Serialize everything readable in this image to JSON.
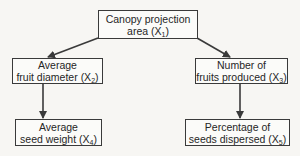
{
  "diagram": {
    "type": "flowchart",
    "nodes": [
      {
        "id": "X1",
        "line1": "Canopy projection",
        "line2_prefix": "area (X",
        "sub": "1",
        "line2_suffix": ")"
      },
      {
        "id": "X2",
        "line1": "Average",
        "line2_prefix": "fruit diameter (X",
        "sub": "2",
        "line2_suffix": ")"
      },
      {
        "id": "X3",
        "line1": "Number of",
        "line2_prefix": "fruits produced (X",
        "sub": "3",
        "line2_suffix": ")"
      },
      {
        "id": "X4",
        "line1": "Average",
        "line2_prefix": "seed weight (X",
        "sub": "4",
        "line2_suffix": ")"
      },
      {
        "id": "X5",
        "line1": "Percentage of",
        "line2_prefix": "seeds dispersed (X",
        "sub": "5",
        "line2_suffix": ")"
      }
    ],
    "edges": [
      {
        "from": "X1",
        "to": "X2"
      },
      {
        "from": "X1",
        "to": "X3"
      },
      {
        "from": "X2",
        "to": "X4"
      },
      {
        "from": "X3",
        "to": "X5"
      }
    ],
    "colors": {
      "background": "#f7f6f3",
      "stroke": "#3a3a3a",
      "text": "#262626"
    }
  }
}
